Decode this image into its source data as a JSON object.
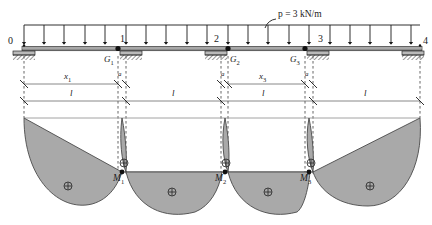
{
  "figure": {
    "type": "structural-engineering-diagram",
    "colors": {
      "line": "#1a1a1a",
      "beam": "#6e6e6e",
      "diagram_fill": "#a8a8a8",
      "diagram_stroke": "#4a4a4a",
      "dash": "#555555"
    }
  },
  "load": {
    "label": "p = 3 kN/m",
    "symbol": "p",
    "equals": " = ",
    "value": "3 kN/m",
    "arrow_count": 20
  },
  "beam": {
    "nodes": [
      {
        "id": "0",
        "label": "0",
        "x": 24
      },
      {
        "id": "1",
        "label": "1",
        "x": 126
      },
      {
        "id": "2",
        "label": "2",
        "x": 228
      },
      {
        "id": "3",
        "label": "3",
        "x": 330
      },
      {
        "id": "4",
        "label": "4",
        "x": 420
      }
    ],
    "hinges": [
      {
        "id": "G1",
        "label": "G",
        "sub": "1"
      },
      {
        "id": "G2",
        "label": "G",
        "sub": "2"
      },
      {
        "id": "G3",
        "label": "G",
        "sub": "3"
      }
    ],
    "supports": [
      {
        "type": "fixed-hatched",
        "at": "0"
      },
      {
        "type": "fixed-hatched",
        "at": "1"
      },
      {
        "type": "fixed-hatched",
        "at": "2"
      },
      {
        "type": "fixed-hatched",
        "at": "3"
      },
      {
        "type": "fixed-hatched",
        "at": "4"
      }
    ]
  },
  "dimensions": {
    "row_upper": [
      {
        "label": "x",
        "sub": "1"
      },
      {
        "label": "a",
        "sub": ""
      },
      {
        "label": "a",
        "sub": ""
      },
      {
        "label": "x",
        "sub": "3"
      },
      {
        "label": "a",
        "sub": ""
      }
    ],
    "row_lower": [
      {
        "label": "l"
      },
      {
        "label": "l"
      },
      {
        "label": "l"
      },
      {
        "label": "l"
      }
    ]
  },
  "moment_diagram": {
    "labels": [
      {
        "label": "M",
        "sub": "1"
      },
      {
        "label": "M",
        "sub": "2"
      },
      {
        "label": "M",
        "sub": "3"
      }
    ],
    "sign_symbol": "⊕",
    "sign_marker_count": 7
  }
}
